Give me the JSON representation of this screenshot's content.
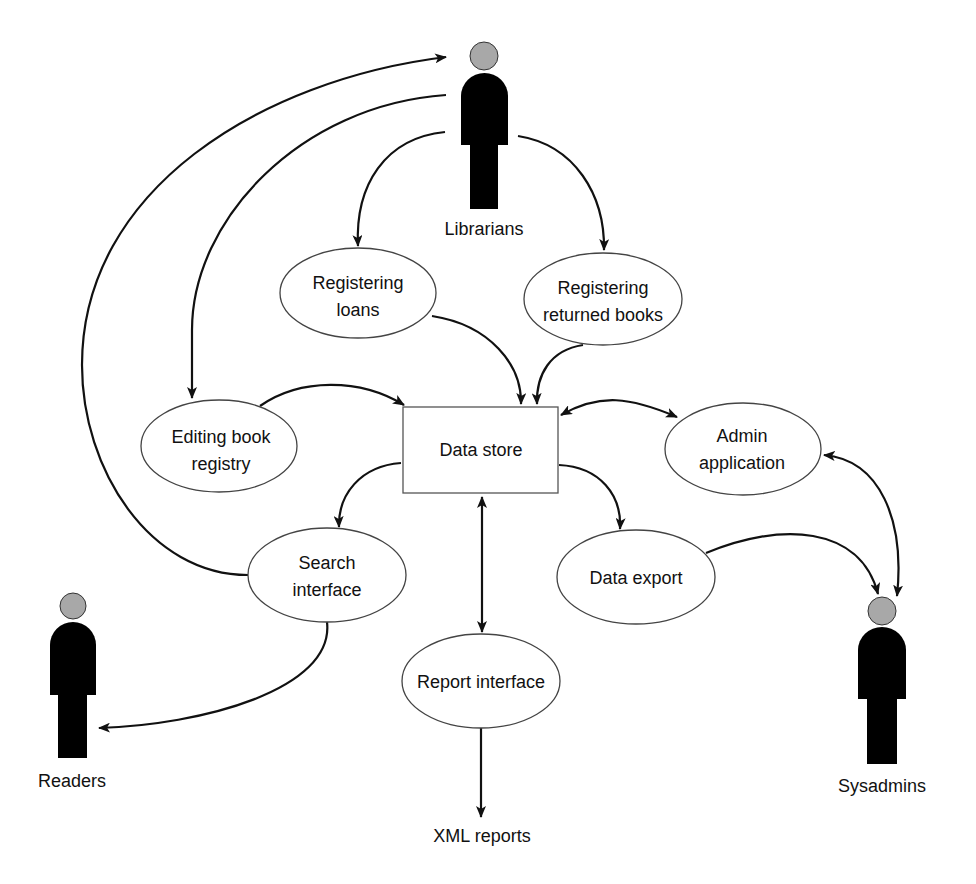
{
  "diagram": {
    "type": "data-flow",
    "actors": {
      "librarians": {
        "label": "Librarians"
      },
      "readers": {
        "label": "Readers"
      },
      "sysadmins": {
        "label": "Sysadmins"
      }
    },
    "processes": {
      "registering_loans": {
        "line1": "Registering",
        "line2": "loans"
      },
      "registering_returned": {
        "line1": "Registering",
        "line2": "returned books"
      },
      "editing_registry": {
        "line1": "Editing book",
        "line2": "registry"
      },
      "admin_application": {
        "line1": "Admin",
        "line2": "application"
      },
      "search_interface": {
        "line1": "Search",
        "line2": "interface"
      },
      "data_export": {
        "label": "Data export"
      },
      "report_interface": {
        "label": "Report interface"
      }
    },
    "store": {
      "label": "Data store"
    },
    "outputs": {
      "xml_reports": {
        "label": "XML reports"
      }
    },
    "edges": [
      {
        "from": "Search interface",
        "to": "Librarians",
        "direction": "one-way"
      },
      {
        "from": "Librarians",
        "to": "Editing book registry",
        "direction": "one-way"
      },
      {
        "from": "Librarians",
        "to": "Registering loans",
        "direction": "one-way"
      },
      {
        "from": "Librarians",
        "to": "Registering returned books",
        "direction": "one-way"
      },
      {
        "from": "Registering loans",
        "to": "Data store",
        "direction": "one-way"
      },
      {
        "from": "Registering returned books",
        "to": "Data store",
        "direction": "one-way"
      },
      {
        "from": "Editing book registry",
        "to": "Data store",
        "direction": "one-way"
      },
      {
        "from": "Data store",
        "to": "Admin application",
        "direction": "two-way"
      },
      {
        "from": "Admin application",
        "to": "Sysadmins",
        "direction": "two-way"
      },
      {
        "from": "Data store",
        "to": "Search interface",
        "direction": "one-way"
      },
      {
        "from": "Data store",
        "to": "Data export",
        "direction": "one-way"
      },
      {
        "from": "Data store",
        "to": "Report interface",
        "direction": "two-way"
      },
      {
        "from": "Data export",
        "to": "Sysadmins",
        "direction": "one-way"
      },
      {
        "from": "Search interface",
        "to": "Readers",
        "direction": "one-way"
      },
      {
        "from": "Report interface",
        "to": "XML reports",
        "direction": "one-way"
      }
    ],
    "colors": {
      "stroke": "#111111",
      "actor_body": "#000000",
      "actor_head": "#a8a8a8",
      "background": "#ffffff"
    }
  }
}
